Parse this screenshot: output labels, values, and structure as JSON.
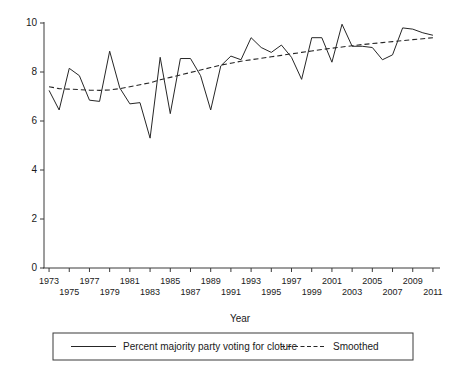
{
  "chart_data": {
    "type": "line",
    "title": "",
    "xlabel": "Year",
    "ylabel": "",
    "xlim": [
      1972.5,
      2011.5
    ],
    "ylim": [
      0,
      10
    ],
    "grid": false,
    "legend_position": "bottom",
    "x": [
      1973,
      1974,
      1975,
      1976,
      1977,
      1978,
      1979,
      1980,
      1981,
      1982,
      1983,
      1984,
      1985,
      1986,
      1987,
      1988,
      1989,
      1990,
      1991,
      1992,
      1993,
      1994,
      1995,
      1996,
      1997,
      1998,
      1999,
      2000,
      2001,
      2002,
      2003,
      2004,
      2005,
      2006,
      2007,
      2008,
      2009,
      2010,
      2011
    ],
    "xtick_labels_top": [
      "1973",
      "1977",
      "1981",
      "1985",
      "1989",
      "1993",
      "1997",
      "2001",
      "2005",
      "2009"
    ],
    "xtick_labels_bottom": [
      "1975",
      "1979",
      "1983",
      "1987",
      "1991",
      "1995",
      "1999",
      "2003",
      "2007",
      "2011"
    ],
    "ytick_labels": [
      "0",
      "2",
      "4",
      "6",
      "8",
      "10"
    ],
    "ytick_values": [
      0,
      2,
      4,
      6,
      8,
      10
    ],
    "series": [
      {
        "name": "Percent majority party voting for cloture",
        "style": "solid",
        "color": "#262626",
        "values": [
          7.25,
          6.45,
          8.15,
          7.85,
          6.85,
          6.8,
          8.85,
          7.35,
          6.7,
          6.75,
          5.3,
          8.6,
          6.3,
          8.55,
          8.55,
          7.85,
          6.45,
          8.25,
          8.65,
          8.5,
          9.4,
          9.0,
          8.8,
          9.1,
          8.6,
          7.7,
          9.4,
          9.4,
          8.4,
          9.95,
          9.05,
          9.05,
          9.0,
          8.5,
          8.7,
          9.8,
          9.75,
          9.6,
          9.5
        ]
      },
      {
        "name": "Smoothed",
        "style": "dashed",
        "color": "#262626",
        "values": [
          7.4,
          7.32,
          7.3,
          7.28,
          7.26,
          7.25,
          7.27,
          7.32,
          7.4,
          7.48,
          7.56,
          7.68,
          7.78,
          7.88,
          7.98,
          8.08,
          8.18,
          8.28,
          8.36,
          8.44,
          8.5,
          8.56,
          8.62,
          8.68,
          8.74,
          8.8,
          8.86,
          8.92,
          8.97,
          9.02,
          9.07,
          9.12,
          9.16,
          9.2,
          9.24,
          9.28,
          9.32,
          9.36,
          9.4
        ]
      }
    ]
  },
  "legend": {
    "items": [
      {
        "label": "Percent majority party voting for cloture",
        "style": "solid"
      },
      {
        "label": "Smoothed",
        "style": "dashed"
      }
    ]
  },
  "axis": {
    "x_title": "Year"
  }
}
